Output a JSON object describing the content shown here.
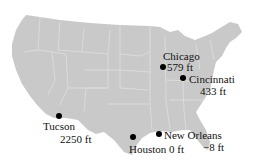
{
  "map": {
    "region": "Contiguous United States",
    "fill_color": "#c9c9c9",
    "border_color": "#e6e6e6",
    "cities": [
      {
        "name": "Chicago",
        "elevation": "579 ft"
      },
      {
        "name": "Cincinnati",
        "elevation": "433 ft"
      },
      {
        "name": "Tucson",
        "elevation": "2250 ft"
      },
      {
        "name": "Houston",
        "elevation": "0 ft"
      },
      {
        "name": "New Orleans",
        "elevation": "−8 ft"
      }
    ]
  }
}
